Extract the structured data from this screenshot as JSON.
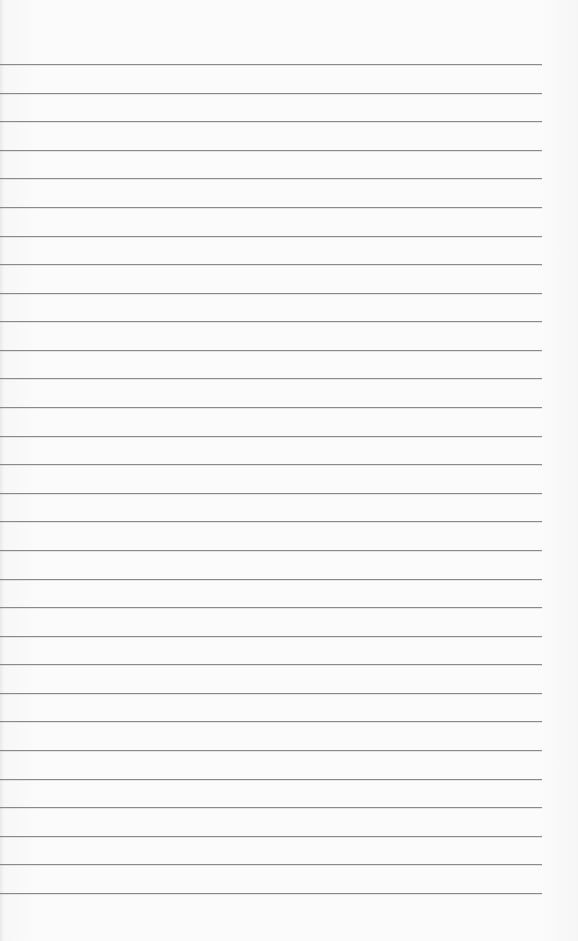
{
  "paper": {
    "type": "lined-paper",
    "line_count": 30,
    "background_color": "#fbfbfb",
    "line_color": "#8a8a8a",
    "text": ""
  }
}
